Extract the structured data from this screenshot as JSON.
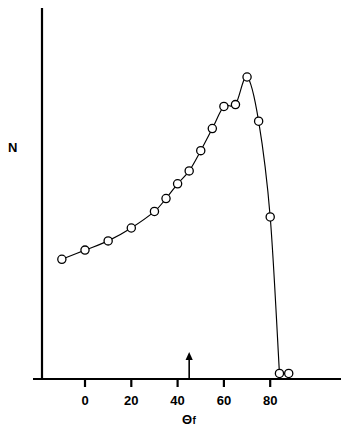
{
  "chart_data": {
    "type": "scatter",
    "title": "",
    "subtitle": "",
    "xlabel": "Θf",
    "xlabel_base": "Θ",
    "xlabel_sub": "f",
    "ylabel": "N",
    "xlim": [
      -18,
      110
    ],
    "ylim": [
      0,
      1.0
    ],
    "grid": false,
    "legend": null,
    "xticks": [
      0,
      20,
      40,
      60,
      80
    ],
    "xtick_labels": [
      "0",
      "20",
      "40",
      "60",
      "80"
    ],
    "yticks": [],
    "ytick_labels": [],
    "series": [
      {
        "name": "N vs Θf",
        "marker": "open-circle",
        "line": "smooth-curve",
        "color": "#000000",
        "x": [
          -10,
          0,
          10,
          20,
          30,
          35,
          40,
          45,
          50,
          55,
          60,
          65,
          70,
          75,
          80,
          84,
          88
        ],
        "y": [
          0.325,
          0.35,
          0.375,
          0.41,
          0.455,
          0.49,
          0.53,
          0.565,
          0.62,
          0.68,
          0.74,
          0.745,
          0.82,
          0.7,
          0.44,
          0.015,
          0.015
        ]
      }
    ],
    "annotations": [
      {
        "name": "up-arrow-marker",
        "type": "arrow",
        "x": 45,
        "direction": "up",
        "label": ""
      }
    ]
  },
  "figure": {
    "background": "#ffffff",
    "axis_color": "#000000",
    "curve_color": "#000000",
    "marker_fill": "#ffffff",
    "marker_stroke": "#000000"
  }
}
